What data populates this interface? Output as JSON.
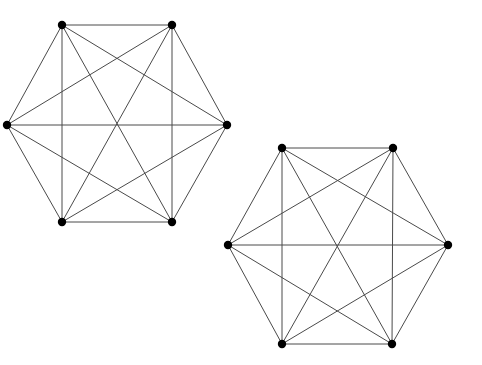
{
  "figure": {
    "background_color": "#ffffff",
    "width": 482,
    "height": 365,
    "edge_color": "#4a4a4a",
    "edge_width": 1,
    "vertex_color": "#000000",
    "vertex_radius": 4.2
  },
  "chart_data": {
    "type": "diagram",
    "subtype": "graph",
    "graphs": [
      {
        "id": "graph-left",
        "label": "Left K6",
        "vertex_count": 6,
        "edge_count": 15,
        "is_complete": true,
        "center": [
          117,
          123.5
        ],
        "vertices": [
          {
            "id": "L0",
            "label": "top-left",
            "x": 62,
            "y": 25
          },
          {
            "id": "L1",
            "label": "top-right",
            "x": 172,
            "y": 25
          },
          {
            "id": "L2",
            "label": "right",
            "x": 227,
            "y": 125
          },
          {
            "id": "L3",
            "label": "bottom-right",
            "x": 172,
            "y": 222
          },
          {
            "id": "L4",
            "label": "bottom-left",
            "x": 62,
            "y": 222
          },
          {
            "id": "L5",
            "label": "left",
            "x": 7,
            "y": 125
          }
        ],
        "edges": [
          [
            "L0",
            "L1"
          ],
          [
            "L0",
            "L2"
          ],
          [
            "L0",
            "L3"
          ],
          [
            "L0",
            "L4"
          ],
          [
            "L0",
            "L5"
          ],
          [
            "L1",
            "L2"
          ],
          [
            "L1",
            "L3"
          ],
          [
            "L1",
            "L4"
          ],
          [
            "L1",
            "L5"
          ],
          [
            "L2",
            "L3"
          ],
          [
            "L2",
            "L4"
          ],
          [
            "L2",
            "L5"
          ],
          [
            "L3",
            "L4"
          ],
          [
            "L3",
            "L5"
          ],
          [
            "L4",
            "L5"
          ]
        ]
      },
      {
        "id": "graph-right",
        "label": "Right K6",
        "vertex_count": 6,
        "edge_count": 15,
        "is_complete": true,
        "center": [
          338,
          246
        ],
        "vertices": [
          {
            "id": "R0",
            "label": "top-left",
            "x": 282,
            "y": 148
          },
          {
            "id": "R1",
            "label": "top-right",
            "x": 393,
            "y": 148
          },
          {
            "id": "R2",
            "label": "right",
            "x": 448,
            "y": 245
          },
          {
            "id": "R3",
            "label": "bottom-right",
            "x": 392,
            "y": 344
          },
          {
            "id": "R4",
            "label": "bottom-left",
            "x": 282,
            "y": 344
          },
          {
            "id": "R5",
            "label": "left",
            "x": 228,
            "y": 245
          }
        ],
        "edges": [
          [
            "R0",
            "R1"
          ],
          [
            "R0",
            "R2"
          ],
          [
            "R0",
            "R3"
          ],
          [
            "R0",
            "R4"
          ],
          [
            "R0",
            "R5"
          ],
          [
            "R1",
            "R2"
          ],
          [
            "R1",
            "R3"
          ],
          [
            "R1",
            "R4"
          ],
          [
            "R1",
            "R5"
          ],
          [
            "R2",
            "R3"
          ],
          [
            "R2",
            "R4"
          ],
          [
            "R2",
            "R5"
          ],
          [
            "R3",
            "R4"
          ],
          [
            "R3",
            "R5"
          ],
          [
            "R4",
            "R5"
          ]
        ]
      }
    ]
  }
}
